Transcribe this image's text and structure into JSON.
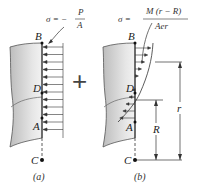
{
  "diagram": {
    "panel_a": {
      "formula_lhs": "σ = −",
      "formula_num": "P",
      "formula_den": "A",
      "points": {
        "B": "B",
        "D": "D",
        "A": "A",
        "C": "C"
      },
      "caption": "(a)"
    },
    "plus_sign": "+",
    "panel_b": {
      "formula_lhs": "σ =",
      "formula_num": "M (r − R)",
      "formula_den": "Aer",
      "points": {
        "B": "B",
        "D": "D",
        "A": "A",
        "C": "C"
      },
      "dimension_R": "R",
      "dimension_r": "r",
      "caption": "(b)"
    },
    "colors": {
      "beam_fill": "#d9d9d9",
      "beam_shade": "#b8b8b8",
      "line": "#333333"
    }
  }
}
